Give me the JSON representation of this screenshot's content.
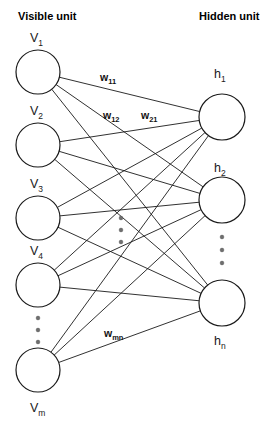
{
  "diagram": {
    "type": "restricted-boltzmann-machine",
    "headers": {
      "visible": "Visible unit",
      "hidden": "Hidden unit"
    },
    "visible_units": [
      {
        "id": "v1",
        "base": "V",
        "sub": "1",
        "label": "V1",
        "cx": 38,
        "cy": 72,
        "r": 22,
        "label_x": 30,
        "label_y": 42,
        "label_pos": "above"
      },
      {
        "id": "v2",
        "base": "V",
        "sub": "2",
        "label": "V2",
        "cx": 38,
        "cy": 145,
        "r": 22,
        "label_x": 30,
        "label_y": 115,
        "label_pos": "above"
      },
      {
        "id": "v3",
        "base": "V",
        "sub": "3",
        "label": "V3",
        "cx": 38,
        "cy": 218,
        "r": 22,
        "label_x": 30,
        "label_y": 188,
        "label_pos": "above"
      },
      {
        "id": "v4",
        "base": "V",
        "sub": "4",
        "label": "V4",
        "cx": 38,
        "cy": 285,
        "r": 22,
        "label_x": 30,
        "label_y": 255,
        "label_pos": "above"
      },
      {
        "id": "vm",
        "base": "V",
        "sub": "m",
        "label": "Vm",
        "cx": 38,
        "cy": 370,
        "r": 22,
        "label_x": 30,
        "label_y": 412,
        "label_pos": "below"
      }
    ],
    "hidden_units": [
      {
        "id": "h1",
        "base": "h",
        "sub": "1",
        "label": "h1",
        "cx": 222,
        "cy": 117,
        "r": 23,
        "label_x": 214,
        "label_y": 78,
        "label_pos": "above"
      },
      {
        "id": "h2",
        "base": "h",
        "sub": "2",
        "label": "h2",
        "cx": 222,
        "cy": 200,
        "r": 23,
        "label_x": 214,
        "label_y": 172,
        "label_pos": "above"
      },
      {
        "id": "hn",
        "base": "h",
        "sub": "n",
        "label": "hn",
        "cx": 222,
        "cy": 303,
        "r": 23,
        "label_x": 214,
        "label_y": 345,
        "label_pos": "below"
      }
    ],
    "weight_labels": [
      {
        "id": "w11",
        "base": "w",
        "sub": "11",
        "label": "w11",
        "x": 100,
        "y": 81
      },
      {
        "id": "w12",
        "base": "w",
        "sub": "12",
        "label": "w12",
        "x": 103,
        "y": 119
      },
      {
        "id": "w21",
        "base": "w",
        "sub": "21",
        "label": "w21",
        "x": 141,
        "y": 119
      },
      {
        "id": "wmn",
        "base": "w",
        "sub": "mn",
        "label": "wmn",
        "x": 104,
        "y": 337
      }
    ],
    "ellipses": [
      {
        "id": "visible-ellipsis",
        "cx": 38,
        "dots_y": [
          318,
          330,
          342
        ]
      },
      {
        "id": "center-ellipsis",
        "cx": 121,
        "dots_y": [
          218,
          230,
          242
        ]
      },
      {
        "id": "hidden-ellipsis",
        "cx": 222,
        "dots_y": [
          237,
          250,
          263
        ]
      }
    ],
    "edges": [
      {
        "from": "v1",
        "to": "h1"
      },
      {
        "from": "v1",
        "to": "h2"
      },
      {
        "from": "v1",
        "to": "hn"
      },
      {
        "from": "v2",
        "to": "h1"
      },
      {
        "from": "v2",
        "to": "h2"
      },
      {
        "from": "v2",
        "to": "hn"
      },
      {
        "from": "v3",
        "to": "h1"
      },
      {
        "from": "v3",
        "to": "h2"
      },
      {
        "from": "v3",
        "to": "hn"
      },
      {
        "from": "v4",
        "to": "h1"
      },
      {
        "from": "v4",
        "to": "h2"
      },
      {
        "from": "v4",
        "to": "hn"
      },
      {
        "from": "vm",
        "to": "h1"
      },
      {
        "from": "vm",
        "to": "h2"
      },
      {
        "from": "vm",
        "to": "hn"
      }
    ],
    "colors": {
      "background": "#ffffff",
      "stroke": "#1a1a1a",
      "text": "#000000",
      "dot": "#6e6e6e"
    }
  }
}
